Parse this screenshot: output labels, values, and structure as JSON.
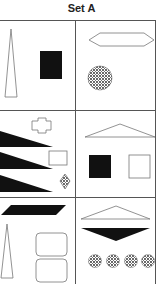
{
  "title": "Set A",
  "panels": [
    {
      "id": "top-left",
      "shapes": [
        "tall-outline-triangle",
        "black-square"
      ]
    },
    {
      "id": "top-right",
      "shapes": [
        "outline-hexagon",
        "dotted-circle"
      ]
    },
    {
      "id": "middle-left",
      "shapes": [
        "outline-cross",
        "black-wedge",
        "outline-rectangle",
        "black-wedge",
        "dotted-diamond",
        "black-wedge"
      ]
    },
    {
      "id": "middle-right",
      "shapes": [
        "outline-wide-triangle",
        "black-square",
        "outline-square"
      ]
    },
    {
      "id": "bottom-left",
      "shapes": [
        "black-parallelogram",
        "tall-outline-triangle",
        "outline-rounded-rectangle",
        "outline-rounded-rectangle"
      ]
    },
    {
      "id": "bottom-right",
      "shapes": [
        "outline-wide-triangle",
        "black-inverted-triangle",
        "dotted-circle",
        "dotted-circle",
        "dotted-circle",
        "dotted-circle"
      ]
    }
  ],
  "colors": {
    "ink": "#111111",
    "line": "#777777",
    "grid": "#555555"
  }
}
